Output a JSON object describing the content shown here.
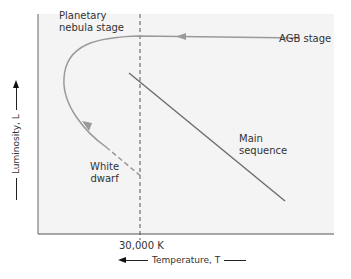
{
  "diagram": {
    "labels": {
      "planetary_nebula": [
        "Planetary",
        "nebula stage"
      ],
      "agb": "AGB stage",
      "main_sequence": [
        "Main",
        "sequence"
      ],
      "white_dwarf": [
        "White",
        "dwarf"
      ],
      "temperature_tick": "30,000 K"
    },
    "axes": {
      "y_label": "Luminosity, L",
      "x_label": "Temperature, T",
      "y_direction": "increasing upward",
      "x_direction": "increasing leftward"
    },
    "colors": {
      "background": "#f4f4f4",
      "track": "#9a9a9a",
      "main_sequence": "#6e6e6e",
      "axis": "#555555",
      "text": "#333333"
    }
  }
}
